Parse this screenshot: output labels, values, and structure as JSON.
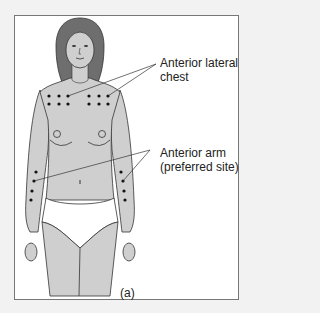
{
  "figure": {
    "labels": {
      "chest": [
        "Anterior lateral",
        "chest"
      ],
      "arm": [
        "Anterior arm",
        "(preferred site)"
      ],
      "panel": "(a)"
    },
    "colors": {
      "skin": "#cfcfcf",
      "hair": "#6e6e6e",
      "outline": "#333333",
      "dot": "#111111",
      "frame": "#777777",
      "background": "#f2f2f2"
    }
  }
}
